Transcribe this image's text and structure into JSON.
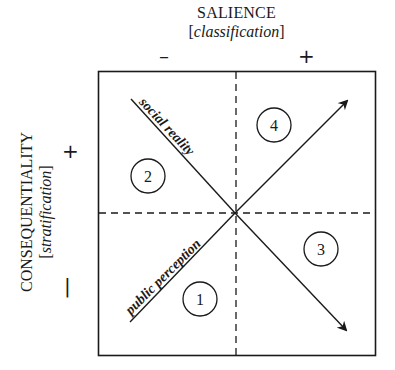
{
  "x_axis": {
    "title": "SALIENCE",
    "subtitle": "classification",
    "minus_label": "–",
    "plus_label": "+"
  },
  "y_axis": {
    "title": "CONSEQUENTIALITY",
    "subtitle": "stratification",
    "plus_label": "+",
    "minus_label": "–"
  },
  "lines": {
    "social_reality": "social reality",
    "public_perception": "public perception"
  },
  "quadrants": [
    {
      "number": "1",
      "position": "bottom-left"
    },
    {
      "number": "2",
      "position": "top-left"
    },
    {
      "number": "3",
      "position": "bottom-right"
    },
    {
      "number": "4",
      "position": "top-right"
    }
  ],
  "colors": {
    "stroke": "#1a1a1a",
    "background": "#ffffff"
  }
}
